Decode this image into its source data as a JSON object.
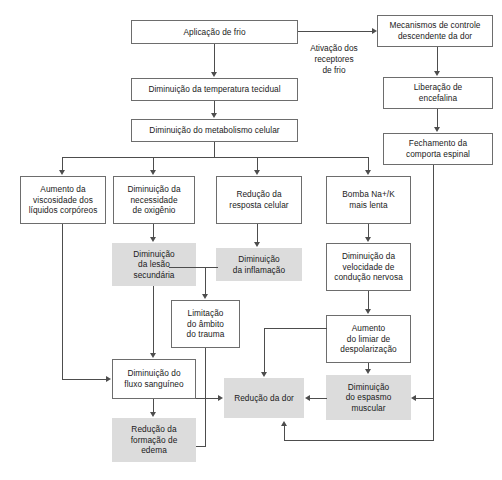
{
  "diagram": {
    "type": "flowchart",
    "colors": {
      "box_fill": "#ffffff",
      "box_border": "#6d6d6d",
      "highlight_fill": "#dcdcdc",
      "connector": "#4d4d4d",
      "text": "#1a1a1a"
    },
    "nodes": [
      {
        "id": "aplicacao_frio",
        "label": "Aplicação de frio",
        "style": "white"
      },
      {
        "id": "mecanismos",
        "label": "Mecanismos de controle\ndescendente da dor",
        "style": "white"
      },
      {
        "id": "temperatura",
        "label": "Diminuição da temperatura tecidual",
        "style": "white"
      },
      {
        "id": "encefalina",
        "label": "Liberação de\nencefalina",
        "style": "white"
      },
      {
        "id": "metabolismo",
        "label": "Diminuição do metabolismo celular",
        "style": "white"
      },
      {
        "id": "comporta",
        "label": "Fechamento da\ncomporta espinal",
        "style": "white"
      },
      {
        "id": "viscosidade",
        "label": "Aumento da\nviscosidade  dos\nlíquidos corpóreos",
        "style": "white"
      },
      {
        "id": "oxigenio",
        "label": "Diminuição da\nnecessidade\nde oxigênio",
        "style": "white"
      },
      {
        "id": "resposta_celular",
        "label": "Redução da\nresposta celular",
        "style": "white"
      },
      {
        "id": "bomba",
        "label": "Bomba Na+/K\nmais lenta",
        "style": "white"
      },
      {
        "id": "lesao_secundaria",
        "label": "Diminuição\nda lesão\nsecundária",
        "style": "gray"
      },
      {
        "id": "inflamacao",
        "label": "Diminuição\nda inflamação",
        "style": "gray"
      },
      {
        "id": "conducao",
        "label": "Diminuição da\nvelocidade de\ncondução nervosa",
        "style": "white"
      },
      {
        "id": "limitacao",
        "label": "Limitação\ndo âmbito\ndo trauma",
        "style": "white"
      },
      {
        "id": "limiar",
        "label": "Aumento\ndo limiar de\ndespolarização",
        "style": "white"
      },
      {
        "id": "fluxo",
        "label": "Diminuição do\nfluxo sanguíneo",
        "style": "white"
      },
      {
        "id": "reducao_dor",
        "label": "Redução da dor",
        "style": "gray"
      },
      {
        "id": "espasmo",
        "label": "Diminuição\ndo espasmo\nmuscular",
        "style": "gray"
      },
      {
        "id": "edema",
        "label": "Redução da\nformação de\nedema",
        "style": "gray"
      }
    ],
    "edge_labels": [
      {
        "id": "ativacao_receptores",
        "label": "Ativação dos\nreceptores\nde frio"
      }
    ]
  }
}
